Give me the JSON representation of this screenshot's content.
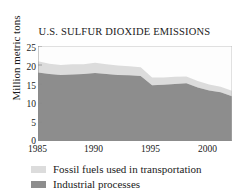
{
  "chart_data": {
    "type": "area",
    "title": "U.S. SULFUR DIOXIDE EMISSIONS",
    "subtitle": "",
    "xlabel": "",
    "ylabel": "Million metric tons",
    "stacked": true,
    "grid": false,
    "legend_position": "bottom-left",
    "ylim": [
      0,
      25
    ],
    "xlim": [
      1985,
      2002
    ],
    "yticks": [
      0,
      5,
      10,
      15,
      20,
      25
    ],
    "ytick_labels": [
      "0",
      "5",
      "10",
      "15",
      "20",
      "25"
    ],
    "xticks": [
      1985,
      1990,
      1995,
      2000
    ],
    "xtick_labels": [
      "1985",
      "1990",
      "1995",
      "2000"
    ],
    "x": [
      1985,
      1986,
      1987,
      1988,
      1989,
      1990,
      1991,
      1992,
      1993,
      1994,
      1995,
      1996,
      1997,
      1998,
      1999,
      2000,
      2001,
      2002
    ],
    "series": [
      {
        "name": "Industrial processes",
        "color": "#8d8d8d",
        "values": [
          18.0,
          17.6,
          17.4,
          17.5,
          17.6,
          17.9,
          17.6,
          17.4,
          17.3,
          17.1,
          14.7,
          14.8,
          15.0,
          15.2,
          14.1,
          13.3,
          12.8,
          11.8
        ]
      },
      {
        "name": "Fossil fuels used in transportation",
        "color": "#dcdcdc",
        "values": [
          3.0,
          2.7,
          2.6,
          2.7,
          2.6,
          2.7,
          2.6,
          2.5,
          2.4,
          2.3,
          2.0,
          1.9,
          1.9,
          1.8,
          1.7,
          1.6,
          1.5,
          1.4
        ]
      }
    ],
    "totals": [
      21.0,
      20.3,
      20.0,
      20.2,
      20.2,
      20.6,
      20.2,
      19.9,
      19.7,
      19.4,
      16.7,
      16.7,
      16.9,
      17.0,
      15.8,
      14.9,
      14.3,
      13.2
    ],
    "legend": [
      {
        "label": "Fossil fuels used in transportation",
        "color": "#dcdcdc"
      },
      {
        "label": "Industrial processes",
        "color": "#8d8d8d"
      }
    ],
    "axis_color": "#9a9a9a",
    "text_color": "#1a1a1a",
    "plot_background": "#fdfdfd"
  }
}
